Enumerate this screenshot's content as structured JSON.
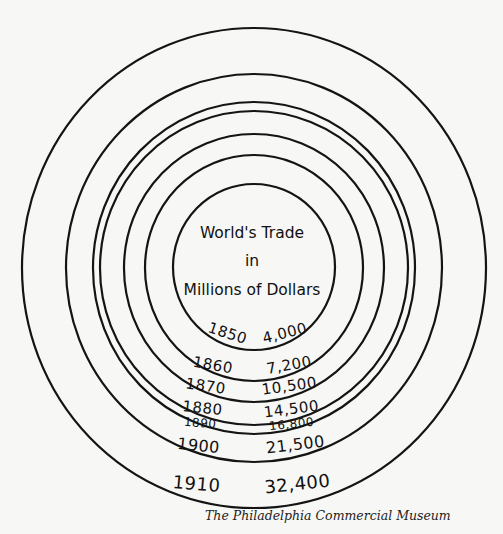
{
  "chart_data": {
    "type": "proportional-circles",
    "title_lines": [
      "World's Trade",
      "in",
      "Millions of Dollars"
    ],
    "unit": "Millions of Dollars",
    "categories": [
      "1850",
      "1860",
      "1870",
      "1880",
      "1890",
      "1900",
      "1910"
    ],
    "values": [
      4000,
      7200,
      10500,
      14500,
      16800,
      21500,
      32400
    ],
    "value_labels": [
      "4,000",
      "7,200",
      "10,500",
      "14,500",
      "16,800",
      "21,500",
      "32,400"
    ],
    "layout": "concentric circles, bottom-aligned labels (year left, value right)"
  },
  "caption": "The Philadelphia Commercial Museum"
}
